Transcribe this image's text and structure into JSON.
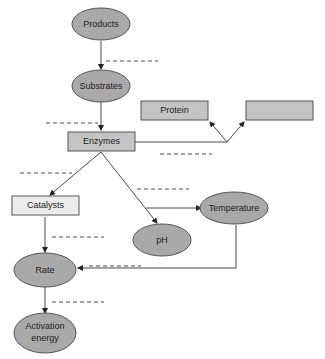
{
  "diagram": {
    "title": "",
    "nodes": [
      {
        "id": "products",
        "label": "Products",
        "shape": "oval",
        "fill": "#a9a9a9"
      },
      {
        "id": "substrates",
        "label": "Substrates",
        "shape": "oval",
        "fill": "#a9a9a9"
      },
      {
        "id": "enzymes",
        "label": "Enzymes",
        "shape": "box",
        "fill": "#c4c4c4"
      },
      {
        "id": "protein",
        "label": "Protein",
        "shape": "box",
        "fill": "#c4c4c4"
      },
      {
        "id": "blank_box",
        "label": "",
        "shape": "box",
        "fill": "#c4c4c4"
      },
      {
        "id": "catalysts",
        "label": "Catalysts",
        "shape": "box",
        "fill": "#ececec"
      },
      {
        "id": "temperature",
        "label": "Temperature",
        "shape": "oval",
        "fill": "#a9a9a9"
      },
      {
        "id": "ph",
        "label": "pH",
        "shape": "oval",
        "fill": "#a9a9a9"
      },
      {
        "id": "rate",
        "label": "Rate",
        "shape": "oval",
        "fill": "#a9a9a9"
      },
      {
        "id": "activation_energy",
        "label_line1": "Activation",
        "label_line2": "energy",
        "shape": "oval",
        "fill": "#a9a9a9"
      }
    ],
    "edges": [
      {
        "from": "products",
        "to": "substrates",
        "label": ""
      },
      {
        "from": "substrates",
        "to": "enzymes",
        "label": ""
      },
      {
        "from": "enzymes",
        "to": "protein",
        "label": ""
      },
      {
        "from": "enzymes",
        "to": "blank_box",
        "label": ""
      },
      {
        "from": "enzymes",
        "to": "catalysts",
        "label": ""
      },
      {
        "from": "enzymes",
        "to": "ph",
        "label": ""
      },
      {
        "from": "enzymes",
        "to": "temperature",
        "label": ""
      },
      {
        "from": "temperature",
        "to": "rate",
        "label": ""
      },
      {
        "from": "catalysts",
        "to": "rate",
        "label": ""
      },
      {
        "from": "rate",
        "to": "activation_energy",
        "label": ""
      }
    ],
    "linking_word_blanks": 8
  }
}
